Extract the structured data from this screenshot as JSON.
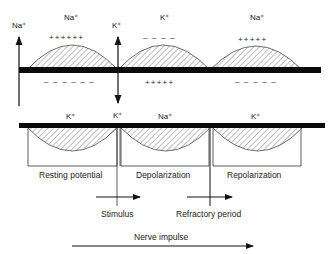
{
  "diagram": {
    "type": "nerve-impulse-membrane",
    "top_membrane": {
      "ions_above": [
        {
          "label": "Na⁺",
          "position": "left-edge-arrow"
        },
        {
          "label": "Na⁺",
          "position": "over-resting-arc"
        },
        {
          "label": "K⁺",
          "position": "center-arrow"
        },
        {
          "label": "K⁺",
          "position": "over-middle-arc"
        },
        {
          "label": "Na⁺",
          "position": "over-right-arc"
        }
      ],
      "charges_above": [
        "++++++",
        "– – – –",
        "+++++"
      ],
      "charges_below": [
        "– – – – – –",
        "+++++",
        "– – – – –"
      ]
    },
    "bottom_membrane": {
      "ions_above": [
        "K⁺",
        "K⁺",
        "Na⁺",
        "K⁺"
      ],
      "regions": [
        "Resting potential",
        "Depolarization",
        "Repolarization"
      ]
    },
    "arrows": {
      "stimulus": "Stimulus",
      "refractory": "Refractory period",
      "nerve_impulse": "Nerve impulse"
    }
  }
}
